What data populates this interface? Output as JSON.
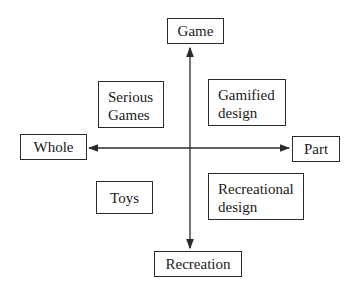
{
  "diagram": {
    "axes": {
      "vertical": {
        "top_label": "Game",
        "bottom_label": "Recreation"
      },
      "horizontal": {
        "left_label": "Whole",
        "right_label": "Part"
      }
    },
    "quadrants": {
      "top_left": {
        "line1": "Serious",
        "line2": "Games"
      },
      "top_right": {
        "line1": "Gamified",
        "line2": "design"
      },
      "bottom_left": {
        "label": "Toys"
      },
      "bottom_right": {
        "line1": "Recreational",
        "line2": "design"
      }
    },
    "colors": {
      "line": "#2a2a2a",
      "background": "#ffffff"
    }
  }
}
